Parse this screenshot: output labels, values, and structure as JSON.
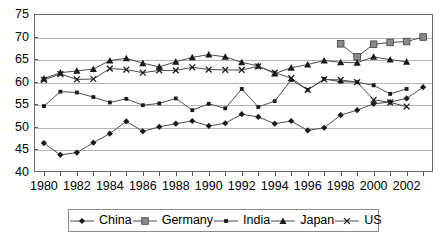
{
  "chart_data": {
    "type": "line",
    "title": "",
    "subtitle": "",
    "xlabel": "",
    "ylabel": "",
    "xlim": [
      1979.4,
      2003.6
    ],
    "ylim": [
      40,
      75
    ],
    "yticks": [
      40,
      45,
      50,
      55,
      60,
      65,
      70,
      75
    ],
    "ytick_labels": [
      "40",
      "45",
      "50",
      "55",
      "60",
      "65",
      "70",
      "75"
    ],
    "x": [
      1980,
      1981,
      1982,
      1983,
      1984,
      1985,
      1986,
      1987,
      1988,
      1989,
      1990,
      1991,
      1992,
      1993,
      1994,
      1995,
      1996,
      1997,
      1998,
      1999,
      2000,
      2001,
      2002,
      2003
    ],
    "xtick_labels": [
      "1980",
      "1982",
      "1984",
      "1986",
      "1988",
      "1990",
      "1992",
      "1994",
      "1996",
      "1998",
      "2000",
      "2002"
    ],
    "xtick_label_values": [
      1980,
      1982,
      1984,
      1986,
      1988,
      1990,
      1992,
      1994,
      1996,
      1998,
      2000,
      2002
    ],
    "xticks_minor": [
      1980,
      1981,
      1982,
      1983,
      1984,
      1985,
      1986,
      1987,
      1988,
      1989,
      1990,
      1991,
      1992,
      1993,
      1994,
      1995,
      1996,
      1997,
      1998,
      1999,
      2000,
      2001,
      2002,
      2003
    ],
    "grid": true,
    "grid_axis": "y",
    "legend_position": "bottom",
    "marker_color": "#1a1a1a",
    "line_color": "#4d4d4d",
    "germany_marker_fill": "#8a8a8a",
    "series": [
      {
        "name": "China",
        "marker": "diamond",
        "x": [
          1980,
          1981,
          1982,
          1983,
          1984,
          1985,
          1986,
          1987,
          1988,
          1989,
          1990,
          1991,
          1992,
          1993,
          1994,
          1995,
          1996,
          1997,
          1998,
          1999,
          2000,
          2001,
          2002,
          2003
        ],
        "values": [
          46.4,
          43.8,
          44.3,
          46.5,
          48.5,
          51.2,
          49.0,
          50.0,
          50.7,
          51.3,
          50.2,
          50.8,
          52.8,
          52.2,
          50.7,
          51.3,
          49.2,
          49.8,
          52.6,
          53.7,
          55.1,
          55.5,
          56.3,
          58.8
        ]
      },
      {
        "name": "Germany",
        "marker": "square",
        "x": [
          1998,
          1999,
          2000,
          2001,
          2002,
          2003
        ],
        "values": [
          68.4,
          65.5,
          68.3,
          68.7,
          68.9,
          69.9
        ]
      },
      {
        "name": "India",
        "marker": "small-square",
        "x": [
          1980,
          1981,
          1982,
          1983,
          1984,
          1985,
          1986,
          1987,
          1988,
          1989,
          1990,
          1991,
          1992,
          1993,
          1994,
          1995,
          1996,
          1997,
          1998,
          1999,
          2000,
          2001,
          2002
        ],
        "values": [
          54.6,
          57.8,
          57.6,
          56.6,
          55.4,
          56.2,
          54.8,
          55.2,
          56.3,
          53.7,
          55.1,
          54.1,
          58.4,
          54.4,
          55.7,
          60.4,
          58.2,
          60.6,
          60.0,
          59.9,
          59.2,
          57.3,
          58.4
        ]
      },
      {
        "name": "Japan",
        "marker": "triangle",
        "x": [
          1980,
          1981,
          1982,
          1983,
          1984,
          1985,
          1986,
          1987,
          1988,
          1989,
          1990,
          1991,
          1992,
          1993,
          1994,
          1995,
          1996,
          1997,
          1998,
          1999,
          2000,
          2001,
          2002
        ],
        "values": [
          60.7,
          62.0,
          62.4,
          62.8,
          64.7,
          65.2,
          64.1,
          63.3,
          64.4,
          65.4,
          66.0,
          65.5,
          64.3,
          63.5,
          61.8,
          63.1,
          63.8,
          64.7,
          64.3,
          64.2,
          65.5,
          64.9,
          64.4
        ]
      },
      {
        "name": "US",
        "marker": "x",
        "x": [
          1980,
          1981,
          1982,
          1983,
          1984,
          1985,
          1986,
          1987,
          1988,
          1989,
          1990,
          1991,
          1992,
          1993,
          1994,
          1995,
          1996,
          1997,
          1998,
          1999,
          2000,
          2001,
          2002
        ],
        "values": [
          60.4,
          61.7,
          60.5,
          60.6,
          62.9,
          62.7,
          62.0,
          62.5,
          62.5,
          63.2,
          62.7,
          62.6,
          62.6,
          63.4,
          62.0,
          60.8,
          58.2,
          60.5,
          60.4,
          59.9,
          56.0,
          55.4,
          54.5
        ]
      }
    ]
  },
  "legend": {
    "items": [
      {
        "label": "China",
        "marker": "diamond"
      },
      {
        "label": "Germany",
        "marker": "square"
      },
      {
        "label": "India",
        "marker": "small-square"
      },
      {
        "label": "Japan",
        "marker": "triangle"
      },
      {
        "label": "US",
        "marker": "x"
      }
    ]
  }
}
